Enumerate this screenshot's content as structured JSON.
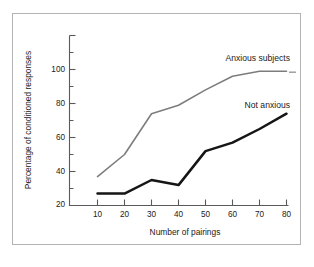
{
  "chart_data": {
    "type": "line",
    "title": "",
    "xlabel": "Number of  pairings",
    "ylabel": "Percentage of conditioned responses",
    "x": [
      10,
      20,
      30,
      40,
      50,
      60,
      70,
      80
    ],
    "xlim": [
      5,
      82
    ],
    "ylim": [
      0,
      100
    ],
    "xticks": [
      10,
      20,
      30,
      40,
      50,
      60,
      70,
      80
    ],
    "yticks": [
      20,
      40,
      60,
      80,
      100
    ],
    "y_minor_ticks": [
      10,
      30,
      50,
      70,
      90
    ],
    "grid": false,
    "legend_position": "inline-annotation",
    "series": [
      {
        "name": "Anxious subjects",
        "color": "#7d7d7d",
        "values": [
          17,
          30,
          54,
          59,
          68,
          76,
          79,
          79
        ]
      },
      {
        "name": "Not anxious",
        "color": "#151515",
        "values": [
          7,
          7,
          15,
          12,
          32,
          37,
          45,
          54
        ]
      }
    ],
    "annotations": [
      {
        "text": "Anxious subjects",
        "x": 63,
        "y": 92
      },
      {
        "text": "Not anxious",
        "x": 66,
        "y": 63
      }
    ]
  },
  "axes": {
    "y_tick_labels": [
      "20",
      "40",
      "60",
      "80",
      "100"
    ],
    "x_tick_labels": [
      "10",
      "20",
      "30",
      "40",
      "50",
      "60",
      "70",
      "80"
    ],
    "x_title": "Number of  pairings",
    "y_title": "Percentage of conditioned responses"
  },
  "series_labels": {
    "anxious": "Anxious subjects",
    "not_anxious": "Not anxious"
  }
}
